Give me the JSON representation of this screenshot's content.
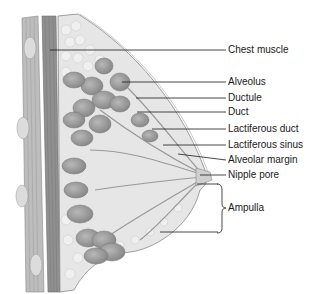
{
  "diagram": {
    "type": "anatomical-cross-section",
    "labels": [
      {
        "id": "chest-muscle",
        "text": "Chest muscle",
        "x": 228,
        "y": 44
      },
      {
        "id": "alveolus",
        "text": "Alveolus",
        "x": 228,
        "y": 77
      },
      {
        "id": "ductule",
        "text": "Ductule",
        "x": 228,
        "y": 93
      },
      {
        "id": "duct",
        "text": "Duct",
        "x": 228,
        "y": 108
      },
      {
        "id": "lactiferous-duct",
        "text": "Lactiferous duct",
        "x": 228,
        "y": 124
      },
      {
        "id": "lactiferous-sinus",
        "text": "Lactiferous sinus",
        "x": 228,
        "y": 140
      },
      {
        "id": "alveolar-margin",
        "text": "Alveolar margin",
        "x": 228,
        "y": 155
      },
      {
        "id": "nipple-pore",
        "text": "Nipple pore",
        "x": 228,
        "y": 170
      },
      {
        "id": "ampulla",
        "text": "Ampulla",
        "x": 228,
        "y": 203
      }
    ],
    "colors": {
      "background": "#ffffff",
      "muscle_outer": "#b5b5b5",
      "muscle_inner": "#8e8e8e",
      "fat": "#e4e4e4",
      "lobule": "#9a9a9a",
      "leader_line": "#1a1a1a"
    }
  }
}
